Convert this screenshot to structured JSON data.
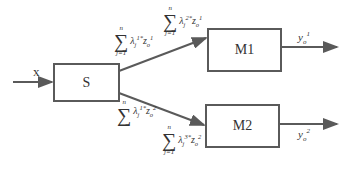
{
  "diagram": {
    "input": {
      "label": "x"
    },
    "nodes": [
      {
        "id": "S",
        "label": "S"
      },
      {
        "id": "M1",
        "label": "M1"
      },
      {
        "id": "M2",
        "label": "M2"
      }
    ],
    "edges": [
      {
        "from": "S",
        "to": "M1",
        "label_near_source": {
          "upper": "n",
          "lower": "j=1",
          "lambda_sup": "1*",
          "z_sup": "1",
          "z_sub": "o",
          "lambda_sub": "j"
        },
        "label_near_target": {
          "upper": "n",
          "lower": "j=1",
          "lambda_sup": "2*",
          "z_sup": "1",
          "z_sub": "o",
          "lambda_sub": "j"
        }
      },
      {
        "from": "S",
        "to": "M2",
        "label_near_source": {
          "upper": "n",
          "lower": "",
          "lambda_sup": "1*",
          "z_sup": "2",
          "z_sub": "o",
          "lambda_sub": "j"
        },
        "label_near_target": {
          "upper": "n",
          "lower": "j=1",
          "lambda_sup": "3*",
          "z_sup": "2",
          "z_sub": "o",
          "lambda_sub": "j"
        }
      }
    ],
    "outputs": [
      {
        "from": "M1",
        "base": "y",
        "sub": "o",
        "sup": "1"
      },
      {
        "from": "M2",
        "base": "y",
        "sub": "o",
        "sup": "2"
      }
    ],
    "colors": {
      "line": "#5a5a5a",
      "text": "#333333",
      "background": "#ffffff"
    }
  }
}
